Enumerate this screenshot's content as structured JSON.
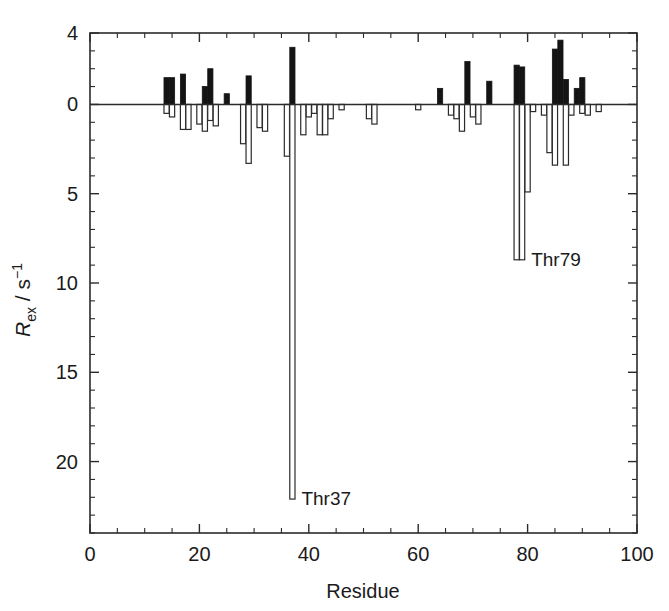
{
  "figure": {
    "title": "",
    "xlabel": "Residue",
    "ylabel_main": "R",
    "ylabel_sub": "ex",
    "ylabel_mid": " / s",
    "ylabel_sup": "−1"
  },
  "annotations": [
    {
      "id": "thr37",
      "text": "Thr37",
      "residue": 37,
      "value": 22.1
    },
    {
      "id": "thr79",
      "text": "Thr79",
      "residue": 79,
      "value": 8.7
    }
  ],
  "axes": {
    "x_ticks": [
      "0",
      "20",
      "40",
      "60",
      "80",
      "100"
    ],
    "x_tick_values": [
      0,
      20,
      40,
      60,
      80,
      100
    ],
    "x_minor_step": 5,
    "y_ticks": [
      "4",
      "0",
      "5",
      "10",
      "15",
      "20"
    ],
    "y_tick_values": [
      -4,
      0,
      5,
      10,
      15,
      20
    ],
    "y_minor_step": 1,
    "xlim": [
      0,
      100
    ],
    "ylim": [
      -4,
      24
    ],
    "y_inverted": true,
    "grid": false
  },
  "colors": {
    "axis": "#2b2b2b",
    "bar_filled": "#141414",
    "bar_open_fill": "#ffffff",
    "bar_open_stroke": "#2b2b2b",
    "text": "#1a1a1a",
    "background": "#ffffff"
  },
  "chart_data": {
    "type": "bar",
    "title": "",
    "xlabel": "Residue",
    "ylabel": "R_ex / s^-1",
    "xlim": [
      0,
      100
    ],
    "ylim": [
      -4,
      24
    ],
    "y_axis_inverted": true,
    "grid": false,
    "legend": [],
    "note": "Bars drawn downward are positive R_ex (open/white bars); bars drawn upward are negative R_ex (filled/black bars). Axis labels read 4 (above zero), 0, 5, 10, 15, 20 going downward.",
    "series": [
      {
        "name": "R_ex filled (negative values, black bars above zero line)",
        "style": "filled",
        "points": [
          {
            "residue": 14,
            "value": -1.5
          },
          {
            "residue": 15,
            "value": -1.5
          },
          {
            "residue": 17,
            "value": -1.7
          },
          {
            "residue": 21,
            "value": -1.0
          },
          {
            "residue": 22,
            "value": -2.0
          },
          {
            "residue": 25,
            "value": -0.6
          },
          {
            "residue": 29,
            "value": -1.6
          },
          {
            "residue": 37,
            "value": -3.2
          },
          {
            "residue": 64,
            "value": -0.9
          },
          {
            "residue": 69,
            "value": -2.4
          },
          {
            "residue": 73,
            "value": -1.3
          },
          {
            "residue": 78,
            "value": -2.2
          },
          {
            "residue": 79,
            "value": -2.1
          },
          {
            "residue": 85,
            "value": -3.1
          },
          {
            "residue": 86,
            "value": -3.6
          },
          {
            "residue": 87,
            "value": -1.4
          },
          {
            "residue": 89,
            "value": -0.9
          },
          {
            "residue": 90,
            "value": -1.5
          }
        ]
      },
      {
        "name": "R_ex open (positive values, white bars below zero line)",
        "style": "open",
        "points": [
          {
            "residue": 14,
            "value": 0.5
          },
          {
            "residue": 15,
            "value": 0.7
          },
          {
            "residue": 17,
            "value": 1.4
          },
          {
            "residue": 18,
            "value": 1.4
          },
          {
            "residue": 20,
            "value": 1.1
          },
          {
            "residue": 21,
            "value": 1.5
          },
          {
            "residue": 22,
            "value": 0.9
          },
          {
            "residue": 23,
            "value": 1.2
          },
          {
            "residue": 28,
            "value": 2.2
          },
          {
            "residue": 29,
            "value": 3.3
          },
          {
            "residue": 31,
            "value": 1.3
          },
          {
            "residue": 32,
            "value": 1.5
          },
          {
            "residue": 36,
            "value": 2.9
          },
          {
            "residue": 37,
            "value": 22.1
          },
          {
            "residue": 39,
            "value": 1.7
          },
          {
            "residue": 40,
            "value": 0.7
          },
          {
            "residue": 41,
            "value": 0.5
          },
          {
            "residue": 42,
            "value": 1.7
          },
          {
            "residue": 43,
            "value": 1.7
          },
          {
            "residue": 44,
            "value": 0.8
          },
          {
            "residue": 46,
            "value": 0.3
          },
          {
            "residue": 51,
            "value": 0.8
          },
          {
            "residue": 52,
            "value": 1.1
          },
          {
            "residue": 60,
            "value": 0.3
          },
          {
            "residue": 66,
            "value": 0.6
          },
          {
            "residue": 67,
            "value": 0.8
          },
          {
            "residue": 68,
            "value": 1.5
          },
          {
            "residue": 70,
            "value": 0.7
          },
          {
            "residue": 71,
            "value": 1.1
          },
          {
            "residue": 78,
            "value": 8.7
          },
          {
            "residue": 79,
            "value": 8.7
          },
          {
            "residue": 80,
            "value": 4.9
          },
          {
            "residue": 81,
            "value": 0.4
          },
          {
            "residue": 83,
            "value": 0.6
          },
          {
            "residue": 84,
            "value": 2.7
          },
          {
            "residue": 85,
            "value": 3.4
          },
          {
            "residue": 87,
            "value": 3.4
          },
          {
            "residue": 88,
            "value": 0.6
          },
          {
            "residue": 90,
            "value": 0.5
          },
          {
            "residue": 91,
            "value": 0.6
          },
          {
            "residue": 93,
            "value": 0.4
          }
        ]
      }
    ]
  }
}
